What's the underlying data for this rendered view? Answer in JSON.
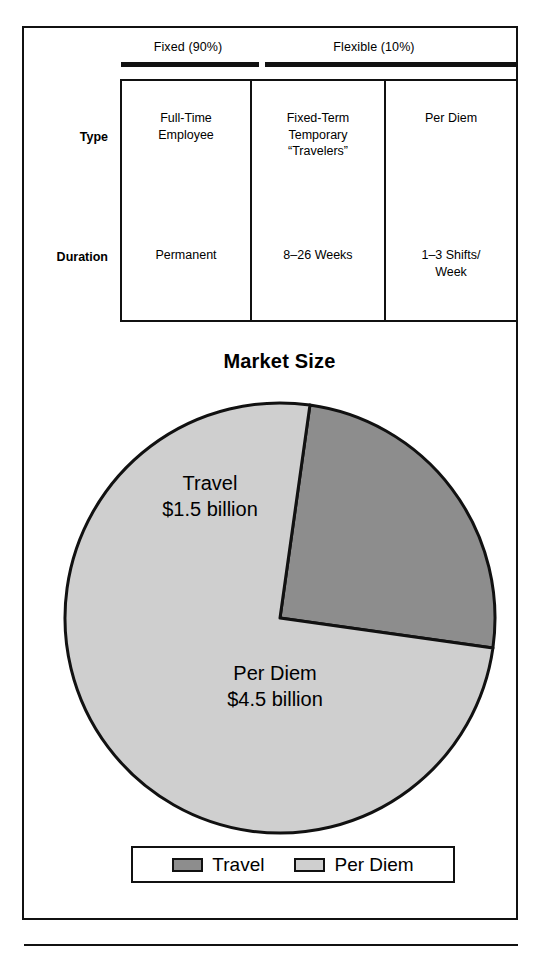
{
  "figure": {
    "group_headers": [
      {
        "label": "Fixed (90%)"
      },
      {
        "label": "Flexible (10%)"
      }
    ],
    "matrix": {
      "row_labels": [
        "Type",
        "Duration"
      ],
      "columns": [
        {
          "type": "Full-Time\nEmployee",
          "duration": "Permanent"
        },
        {
          "type": "Fixed-Term\nTemporary\n“Travelers”",
          "duration": "8–26 Weeks"
        },
        {
          "type": "Per Diem",
          "duration": "1–3 Shifts/\nWeek"
        }
      ]
    },
    "chart_data": {
      "type": "pie",
      "title": "Market Size",
      "xlabel": "",
      "ylabel": "",
      "unit": "billion USD",
      "categories": [
        "Travel",
        "Per Diem"
      ],
      "values": [
        1.5,
        4.5
      ],
      "value_labels": [
        "$1.5 billion",
        "$4.5 billion"
      ],
      "slice_labels": [
        "Travel\n$1.5 billion",
        "Per Diem\n$4.5 billion"
      ],
      "percentages": [
        25,
        75
      ],
      "colors": [
        "#8d8d8d",
        "#cfcfcf"
      ],
      "start_angle_deg": 8,
      "legend": {
        "position": "bottom",
        "entries": [
          {
            "label": "Travel",
            "color": "#8d8d8d"
          },
          {
            "label": "Per Diem",
            "color": "#cfcfcf"
          }
        ]
      }
    }
  }
}
